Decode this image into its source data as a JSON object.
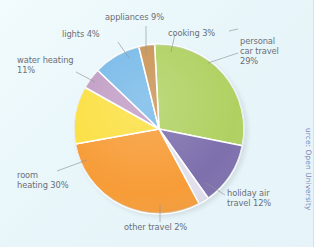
{
  "figure": {
    "background": "#eaf7fa",
    "source_note": "urce: Open University"
  },
  "chart_data": {
    "type": "pie",
    "title": "",
    "categories": [
      "personal car travel",
      "holiday air travel",
      "other travel",
      "room heating",
      "water heating",
      "lights",
      "appliances",
      "cooking"
    ],
    "values": [
      29,
      12,
      2,
      30,
      11,
      4,
      9,
      3
    ],
    "units": "%",
    "colors": [
      "#aed05e",
      "#7b6cab",
      "#e2dfee",
      "#f79a33",
      "#fbdf3e",
      "#c09bc4",
      "#74b8e8",
      "#c89050"
    ],
    "legend": "none",
    "labels_position": "outside-with-leader-lines",
    "slices": [
      {
        "label": "personal\ncar travel\n29%",
        "name": "personal car travel",
        "value": 29,
        "color": "#aed05e"
      },
      {
        "label": "holiday air\ntravel 12%",
        "name": "holiday air travel",
        "value": 12,
        "color": "#7b6cab"
      },
      {
        "label": "other travel 2%",
        "name": "other travel",
        "value": 2,
        "color": "#e2dfee"
      },
      {
        "label": "room\nheating 30%",
        "name": "room heating",
        "value": 30,
        "color": "#f79a33"
      },
      {
        "label": "water heating\n11%",
        "name": "water heating",
        "value": 11,
        "color": "#fbdf3e"
      },
      {
        "label": "lights 4%",
        "name": "lights",
        "value": 4,
        "color": "#c09bc4"
      },
      {
        "label": "appliances 9%",
        "name": "appliances",
        "value": 9,
        "color": "#74b8e8"
      },
      {
        "label": "cooking 3%",
        "name": "cooking",
        "value": 3,
        "color": "#c89050"
      }
    ]
  },
  "labels": {
    "appliances": "appliances 9%",
    "cooking": "cooking 3%",
    "personal_car_travel": "personal\ncar travel\n29%",
    "holiday_air_travel": "holiday air\ntravel 12%",
    "other_travel": "other travel 2%",
    "room_heating": "room\nheating 30%",
    "water_heating": "water heating\n11%",
    "lights": "lights 4%"
  }
}
